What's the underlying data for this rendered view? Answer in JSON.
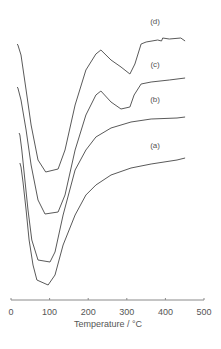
{
  "chart_data": {
    "type": "line",
    "title": "",
    "xlabel": "Temperature / °C",
    "ylabel": "",
    "xlim": [
      0,
      500
    ],
    "x_ticks": [
      0,
      100,
      200,
      300,
      400,
      500
    ],
    "x_tick_labels": [
      "0",
      "100",
      "200",
      "300",
      "400",
      "500"
    ],
    "y_axis_shown": false,
    "grid": false,
    "legend": "inline labels to the right of each curve",
    "y_units": "relative signal (arbitrary, curves vertically offset)",
    "series": [
      {
        "name": "(a)",
        "label_pos": [
          394,
          152
        ],
        "points": [
          [
            23,
            137
          ],
          [
            26,
            133
          ],
          [
            31,
            118
          ],
          [
            39,
            90
          ],
          [
            47,
            60
          ],
          [
            57,
            35
          ],
          [
            67,
            20
          ],
          [
            96,
            15
          ],
          [
            114,
            25
          ],
          [
            135,
            55
          ],
          [
            166,
            85
          ],
          [
            194,
            105
          ],
          [
            220,
            115
          ],
          [
            259,
            125
          ],
          [
            311,
            132
          ],
          [
            363,
            136
          ],
          [
            430,
            140
          ],
          [
            451,
            142
          ]
        ]
      },
      {
        "name": "(b)",
        "label_pos": [
          394,
          198
        ],
        "points": [
          [
            21,
            167
          ],
          [
            23,
            165
          ],
          [
            28,
            150
          ],
          [
            36,
            120
          ],
          [
            44,
            90
          ],
          [
            54,
            60
          ],
          [
            70,
            40
          ],
          [
            101,
            38
          ],
          [
            114,
            48
          ],
          [
            135,
            85
          ],
          [
            166,
            130
          ],
          [
            194,
            150
          ],
          [
            220,
            163
          ],
          [
            259,
            172
          ],
          [
            311,
            178
          ],
          [
            363,
            181
          ],
          [
            430,
            182
          ],
          [
            451,
            183
          ]
        ]
      },
      {
        "name": "(c)",
        "label_pos": [
          394,
          233
        ],
        "points": [
          [
            16,
            213
          ],
          [
            18,
            212
          ],
          [
            26,
            200
          ],
          [
            39,
            170
          ],
          [
            52,
            135
          ],
          [
            70,
            100
          ],
          [
            88,
            86
          ],
          [
            122,
            88
          ],
          [
            140,
            105
          ],
          [
            166,
            150
          ],
          [
            194,
            185
          ],
          [
            220,
            205
          ],
          [
            233,
            209
          ],
          [
            259,
            198
          ],
          [
            285,
            191
          ],
          [
            308,
            193
          ],
          [
            319,
            205
          ],
          [
            337,
            216
          ],
          [
            363,
            218
          ],
          [
            410,
            220
          ],
          [
            451,
            222
          ]
        ]
      },
      {
        "name": "(d)",
        "label_pos": [
          394,
          276
        ],
        "points": [
          [
            16,
            256
          ],
          [
            18,
            255
          ],
          [
            26,
            245
          ],
          [
            39,
            210
          ],
          [
            52,
            175
          ],
          [
            70,
            140
          ],
          [
            90,
            128
          ],
          [
            122,
            131
          ],
          [
            140,
            150
          ],
          [
            166,
            195
          ],
          [
            194,
            230
          ],
          [
            220,
            246
          ],
          [
            233,
            250
          ],
          [
            259,
            240
          ],
          [
            285,
            233
          ],
          [
            308,
            226
          ],
          [
            321,
            236
          ],
          [
            337,
            256
          ],
          [
            350,
            258
          ],
          [
            380,
            260
          ],
          [
            390,
            259
          ],
          [
            393,
            262
          ],
          [
            410,
            261
          ],
          [
            440,
            262
          ],
          [
            451,
            259
          ]
        ]
      }
    ]
  },
  "axis": {
    "title": "Temperature / °C",
    "tick_labels": [
      "0",
      "100",
      "200",
      "300",
      "400",
      "500"
    ]
  },
  "labels": {
    "a": "(a)",
    "b": "(b)",
    "c": "(c)",
    "d": "(d)"
  },
  "colors": {
    "curve": "#5a5a5a",
    "axis": "#8a8a8a",
    "text": "#555555"
  }
}
